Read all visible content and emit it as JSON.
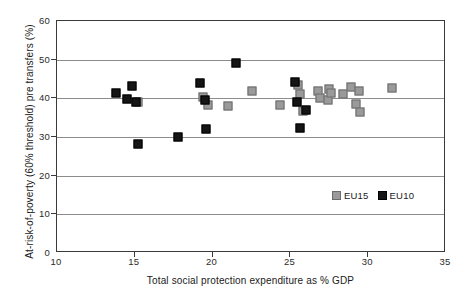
{
  "chart_data": {
    "type": "scatter",
    "title": "",
    "xlabel": "Total social protection expenditure as % GDP",
    "ylabel": "At-risk-of-poverty (60% threshold) pre transfers (%)",
    "xlim": [
      10,
      35
    ],
    "ylim": [
      0,
      60
    ],
    "xticks": [
      10,
      15,
      20,
      25,
      30,
      35
    ],
    "yticks": [
      0,
      10,
      20,
      30,
      40,
      50,
      60
    ],
    "grid": "horizontal",
    "legend_position": "inside-lower-right",
    "series": [
      {
        "name": "EU15",
        "color": "#9a9a9a",
        "marker": "square",
        "points": [
          {
            "x": 15.2,
            "y": 39.0
          },
          {
            "x": 19.4,
            "y": 40.3
          },
          {
            "x": 19.7,
            "y": 38.2
          },
          {
            "x": 21.0,
            "y": 38.0
          },
          {
            "x": 22.5,
            "y": 41.8
          },
          {
            "x": 24.3,
            "y": 38.3
          },
          {
            "x": 25.5,
            "y": 43.5
          },
          {
            "x": 25.6,
            "y": 41.0
          },
          {
            "x": 25.8,
            "y": 36.8
          },
          {
            "x": 26.8,
            "y": 41.8
          },
          {
            "x": 26.9,
            "y": 40.1
          },
          {
            "x": 27.4,
            "y": 39.6
          },
          {
            "x": 27.5,
            "y": 42.5
          },
          {
            "x": 27.6,
            "y": 41.4
          },
          {
            "x": 28.4,
            "y": 41.2
          },
          {
            "x": 28.9,
            "y": 43.0
          },
          {
            "x": 29.2,
            "y": 38.6
          },
          {
            "x": 29.4,
            "y": 41.9
          },
          {
            "x": 29.5,
            "y": 36.5
          },
          {
            "x": 31.5,
            "y": 42.8
          }
        ]
      },
      {
        "name": "EU10",
        "color": "#151515",
        "marker": "square",
        "points": [
          {
            "x": 13.8,
            "y": 41.3
          },
          {
            "x": 14.5,
            "y": 39.9
          },
          {
            "x": 14.8,
            "y": 43.2
          },
          {
            "x": 15.1,
            "y": 39.0
          },
          {
            "x": 15.2,
            "y": 28.2
          },
          {
            "x": 17.8,
            "y": 30.1
          },
          {
            "x": 19.2,
            "y": 44.0
          },
          {
            "x": 19.5,
            "y": 39.5
          },
          {
            "x": 19.6,
            "y": 32.0
          },
          {
            "x": 21.5,
            "y": 49.2
          },
          {
            "x": 25.3,
            "y": 44.1
          },
          {
            "x": 25.4,
            "y": 39.0
          },
          {
            "x": 25.6,
            "y": 32.3
          },
          {
            "x": 26.0,
            "y": 37.0
          }
        ]
      }
    ]
  },
  "legend": {
    "entries": [
      {
        "label": "EU15",
        "key": "eu15"
      },
      {
        "label": "EU10",
        "key": "eu10"
      }
    ]
  },
  "axes": {
    "y_tick_labels": [
      "60",
      "50",
      "40",
      "30",
      "20",
      "10",
      "0"
    ],
    "x_tick_labels": [
      "10",
      "15",
      "20",
      "25",
      "30",
      "35"
    ]
  }
}
